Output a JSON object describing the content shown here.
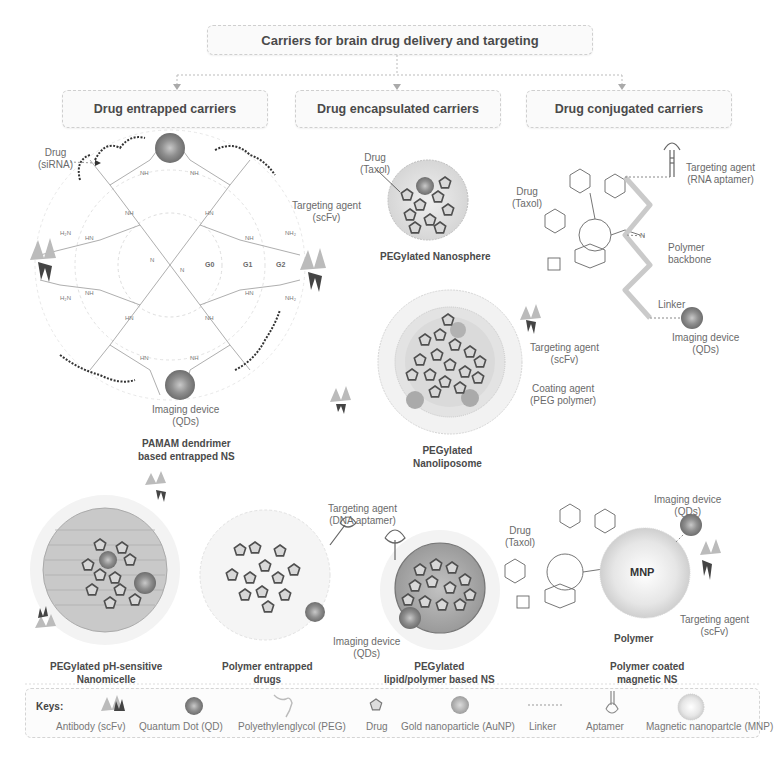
{
  "title": "Carriers for brain drug delivery and targeting",
  "categories": [
    {
      "label": "Drug entrapped carriers"
    },
    {
      "label": "Drug encapsulated carriers"
    },
    {
      "label": "Drug conjugated carriers"
    }
  ],
  "dendrimer": {
    "drug_label_line1": "Drug",
    "drug_label_line2": "(siRNA)",
    "targeting_line1": "Targeting agent",
    "targeting_line2": "(scFv)",
    "imaging_line1": "Imaging device",
    "imaging_line2": "(QDs)",
    "generations": [
      "G0",
      "G1",
      "G2"
    ],
    "title_line1": "PAMAM dendrimer",
    "title_line2": "based entrapped NS"
  },
  "nanosphere": {
    "drug_line1": "Drug",
    "drug_line2": "(Taxol)",
    "title": "PEGylated Nanosphere"
  },
  "conjugate": {
    "drug_line1": "Drug",
    "drug_line2": "(Taxol)",
    "targeting_line1": "Targeting agent",
    "targeting_line2": "(RNA aptamer)",
    "backbone_line1": "Polymer",
    "backbone_line2": "backbone",
    "linker": "Linker",
    "imaging_line1": "Imaging device",
    "imaging_line2": "(QDs)"
  },
  "nanoliposome": {
    "targeting_line1": "Targeting agent",
    "targeting_line2": "(scFv)",
    "coating_line1": "Coating agent",
    "coating_line2": "(PEG polymer)",
    "title_line1": "PEGylated",
    "title_line2": "Nanoliposome"
  },
  "nanomicelle": {
    "title_line1": "PEGylated pH-sensitive",
    "title_line2": "Nanomicelle"
  },
  "polymer_entrapped": {
    "targeting_line1": "Targeting agent",
    "targeting_line2": "(DNA aptamer)",
    "imaging_line1": "Imaging device",
    "imaging_line2": "(QDs)",
    "title_line1": "Polymer entrapped",
    "title_line2": "drugs"
  },
  "lipid_polymer": {
    "title_line1": "PEGylated",
    "title_line2": "lipid/polymer based NS"
  },
  "magnetic": {
    "drug_line1": "Drug",
    "drug_line2": "(Taxol)",
    "core_label": "MNP",
    "polymer_label": "Polymer",
    "imaging_line1": "Imaging device",
    "imaging_line2": "(QDs)",
    "targeting_line1": "Targeting agent",
    "targeting_line2": "(scFv)",
    "title_line1": "Polymer coated",
    "title_line2": "magnetic NS"
  },
  "keys": {
    "heading": "Keys:",
    "items": [
      {
        "label": "Antibody (scFv)",
        "icon": "antibody-icon"
      },
      {
        "label": "Quantum Dot (QD)",
        "icon": "quantum-dot-icon"
      },
      {
        "label": "Polyethylenglycol (PEG)",
        "icon": "peg-icon"
      },
      {
        "label": "Drug",
        "icon": "drug-icon"
      },
      {
        "label": "Gold nanoparticle (AuNP)",
        "icon": "gold-nanoparticle-icon"
      },
      {
        "label": "Linker",
        "icon": "linker-icon"
      },
      {
        "label": "Aptamer",
        "icon": "aptamer-icon"
      },
      {
        "label": "Magnetic nanopartcle (MNP)",
        "icon": "magnetic-nanoparticle-icon"
      }
    ]
  },
  "colors": {
    "quantum_dot": "#8a8a8a",
    "drug_outline": "#555555",
    "peg": "#c8c8c8",
    "backbone": "#c9c9c9",
    "box_border": "#cfcfcf",
    "text": "#4a4a4a"
  }
}
